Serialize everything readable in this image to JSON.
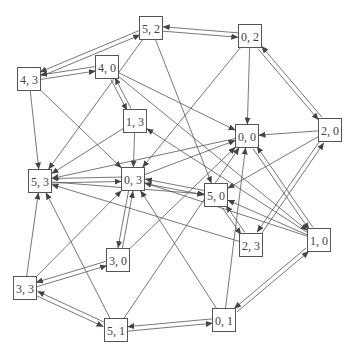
{
  "diagram": {
    "type": "directed-graph",
    "node_size": 23,
    "colors": {
      "stroke": "#555555",
      "text": "#444444",
      "background": "#ffffff"
    },
    "nodes": [
      {
        "id": "5,2",
        "label": "5, 2",
        "x": 151,
        "y": 28
      },
      {
        "id": "0,2",
        "label": "0, 2",
        "x": 250,
        "y": 36
      },
      {
        "id": "4,3",
        "label": "4, 3",
        "x": 29,
        "y": 79
      },
      {
        "id": "4,0",
        "label": "4, 0",
        "x": 107,
        "y": 67
      },
      {
        "id": "1,3",
        "label": "1, 3",
        "x": 135,
        "y": 121
      },
      {
        "id": "0,0",
        "label": "0, 0",
        "x": 247,
        "y": 136
      },
      {
        "id": "2,0",
        "label": "2, 0",
        "x": 330,
        "y": 130
      },
      {
        "id": "5,3",
        "label": "5, 3",
        "x": 40,
        "y": 181
      },
      {
        "id": "0,3",
        "label": "0, 3",
        "x": 133,
        "y": 179
      },
      {
        "id": "5,0",
        "label": "5, 0",
        "x": 216,
        "y": 195
      },
      {
        "id": "2,3",
        "label": "2, 3",
        "x": 251,
        "y": 245
      },
      {
        "id": "1,0",
        "label": "1, 0",
        "x": 319,
        "y": 240
      },
      {
        "id": "3,0",
        "label": "3, 0",
        "x": 118,
        "y": 260
      },
      {
        "id": "3,3",
        "label": "3, 3",
        "x": 25,
        "y": 288
      },
      {
        "id": "5,1",
        "label": "5, 1",
        "x": 116,
        "y": 330
      },
      {
        "id": "0,1",
        "label": "0, 1",
        "x": 224,
        "y": 320
      }
    ],
    "edges": [
      [
        "5,2",
        "0,2"
      ],
      [
        "0,2",
        "5,2"
      ],
      [
        "5,2",
        "4,3"
      ],
      [
        "4,3",
        "5,2"
      ],
      [
        "4,0",
        "4,3"
      ],
      [
        "4,3",
        "4,0"
      ],
      [
        "4,3",
        "5,3"
      ],
      [
        "4,3",
        "0,3"
      ],
      [
        "5,2",
        "5,3"
      ],
      [
        "5,2",
        "5,0"
      ],
      [
        "4,0",
        "1,3"
      ],
      [
        "1,3",
        "4,0"
      ],
      [
        "4,0",
        "0,0"
      ],
      [
        "4,0",
        "1,0"
      ],
      [
        "0,2",
        "0,0"
      ],
      [
        "0,2",
        "0,3"
      ],
      [
        "0,2",
        "2,0"
      ],
      [
        "2,0",
        "0,2"
      ],
      [
        "2,0",
        "0,0"
      ],
      [
        "2,0",
        "5,0"
      ],
      [
        "1,3",
        "0,3"
      ],
      [
        "1,3",
        "5,3"
      ],
      [
        "1,0",
        "1,3"
      ],
      [
        "5,3",
        "0,3"
      ],
      [
        "0,3",
        "5,3"
      ],
      [
        "5,3",
        "5,0"
      ],
      [
        "0,0",
        "5,3"
      ],
      [
        "0,3",
        "0,0"
      ],
      [
        "0,3",
        "5,0"
      ],
      [
        "5,0",
        "0,3"
      ],
      [
        "0,3",
        "3,0"
      ],
      [
        "3,0",
        "0,3"
      ],
      [
        "5,0",
        "2,3"
      ],
      [
        "2,3",
        "5,0"
      ],
      [
        "1,0",
        "5,0"
      ],
      [
        "1,0",
        "0,3"
      ],
      [
        "2,3",
        "5,3"
      ],
      [
        "2,3",
        "2,0"
      ],
      [
        "2,0",
        "2,3"
      ],
      [
        "3,0",
        "0,0"
      ],
      [
        "3,0",
        "3,3"
      ],
      [
        "3,3",
        "3,0"
      ],
      [
        "3,3",
        "5,3"
      ],
      [
        "3,3",
        "0,3"
      ],
      [
        "3,3",
        "5,1"
      ],
      [
        "5,1",
        "3,3"
      ],
      [
        "5,1",
        "5,3"
      ],
      [
        "5,1",
        "0,0"
      ],
      [
        "5,1",
        "0,1"
      ],
      [
        "0,1",
        "5,1"
      ],
      [
        "0,1",
        "1,0"
      ],
      [
        "1,0",
        "0,1"
      ],
      [
        "0,1",
        "0,3"
      ],
      [
        "0,1",
        "0,0"
      ],
      [
        "1,0",
        "0,0"
      ],
      [
        "0,0",
        "1,0"
      ]
    ]
  }
}
